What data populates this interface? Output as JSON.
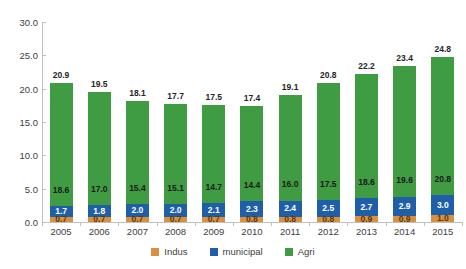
{
  "chart_data": {
    "type": "bar",
    "subtype": "stacked-vertical",
    "title": "",
    "xlabel": "",
    "ylabel": "",
    "ylim": [
      0.0,
      30.0
    ],
    "ytick_step": 5.0,
    "ytick_labels": [
      "0.0",
      "5.0",
      "10.0",
      "15.0",
      "20.0",
      "25.0",
      "30.0"
    ],
    "ytick_values": [
      0.0,
      5.0,
      10.0,
      15.0,
      20.0,
      25.0,
      30.0
    ],
    "grid": false,
    "legend_position": "bottom",
    "categories": [
      "2005",
      "2006",
      "2007",
      "2008",
      "2009",
      "2010",
      "2011",
      "2012",
      "2013",
      "2014",
      "2015"
    ],
    "series": [
      {
        "name": "Indus",
        "color": "#d9913f",
        "values": [
          0.7,
          0.7,
          0.7,
          0.7,
          0.7,
          0.8,
          0.8,
          0.8,
          0.9,
          0.9,
          1.0
        ],
        "labels": [
          "0.7",
          "0.7",
          "0.7",
          "0.7",
          "0.7",
          "0.8",
          "0.8",
          "0.8",
          "0.9",
          "0.9",
          "1.0"
        ]
      },
      {
        "name": "municipal",
        "color": "#1f5fa9",
        "values": [
          1.7,
          1.8,
          2.0,
          2.0,
          2.1,
          2.3,
          2.4,
          2.5,
          2.7,
          2.9,
          3.0
        ],
        "labels": [
          "1.7",
          "1.8",
          "2.0",
          "2.0",
          "2.1",
          "2.3",
          "2.4",
          "2.5",
          "2.7",
          "2.9",
          "3.0"
        ]
      },
      {
        "name": "Agri",
        "color": "#3f9c43",
        "values": [
          18.6,
          17.0,
          15.4,
          15.1,
          14.7,
          14.4,
          16.0,
          17.5,
          18.6,
          19.6,
          20.8
        ],
        "labels": [
          "18.6",
          "17.0",
          "15.4",
          "15.1",
          "14.7",
          "14.4",
          "16.0",
          "17.5",
          "18.6",
          "19.6",
          "20.8"
        ]
      }
    ],
    "totals": [
      20.9,
      19.5,
      18.1,
      17.7,
      17.5,
      17.4,
      19.1,
      20.8,
      22.2,
      23.4,
      24.8
    ],
    "total_labels": [
      "20.9",
      "19.5",
      "18.1",
      "17.7",
      "17.5",
      "17.4",
      "19.1",
      "20.8",
      "22.2",
      "23.4",
      "24.8"
    ]
  },
  "legend": {
    "items": [
      {
        "label": "Indus",
        "color": "#d9913f"
      },
      {
        "label": "municipal",
        "color": "#1f5fa9"
      },
      {
        "label": "Agri",
        "color": "#3f9c43"
      }
    ]
  }
}
